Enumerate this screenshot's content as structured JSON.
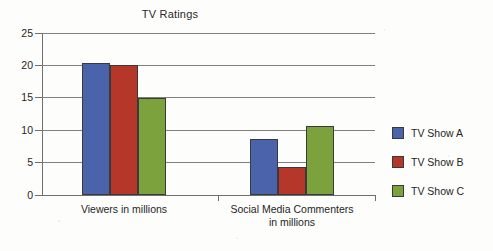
{
  "chart_data": {
    "type": "bar",
    "title": "TV Ratings",
    "xlabel": "",
    "ylabel": "",
    "ylim": [
      0,
      25
    ],
    "yticks": [
      0,
      5,
      10,
      15,
      20,
      25
    ],
    "ytick_labels": [
      "0",
      "5",
      "10",
      "15",
      "20",
      "25"
    ],
    "grid": true,
    "legend_position": "right",
    "categories": [
      "Viewers in millions",
      "Social Media Commenters in millions"
    ],
    "category_lines": [
      [
        "Viewers in millions"
      ],
      [
        "Social Media Commenters",
        "in millions"
      ]
    ],
    "series": [
      {
        "name": "TV Show A",
        "color": "#4a63ab",
        "values": [
          20.4,
          8.6
        ]
      },
      {
        "name": "TV Show B",
        "color": "#b5372a",
        "values": [
          20.0,
          4.3
        ]
      },
      {
        "name": "TV Show C",
        "color": "#7ba23c",
        "values": [
          14.9,
          10.7
        ]
      }
    ]
  },
  "legend": {
    "entries": [
      {
        "label": "TV Show A",
        "color": "#4a63ab"
      },
      {
        "label": "TV Show B",
        "color": "#b5372a"
      },
      {
        "label": "TV Show C",
        "color": "#7ba23c"
      }
    ]
  }
}
